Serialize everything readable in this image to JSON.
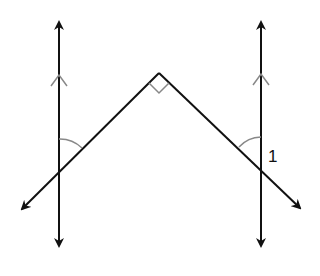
{
  "diagram": {
    "type": "geometry",
    "colors": {
      "line": "#111111",
      "mark": "#888888",
      "background": "#ffffff"
    },
    "parallel_lines": [
      {
        "id": "left",
        "x": 59,
        "y_top": 20,
        "y_bottom": 248,
        "parallel_marker": "arrow"
      },
      {
        "id": "right",
        "x": 261,
        "y_top": 20,
        "y_bottom": 248,
        "parallel_marker": "arrow"
      }
    ],
    "transversals": [
      {
        "id": "left-diagonal",
        "from": [
          159,
          73
        ],
        "to": [
          20,
          211
        ]
      },
      {
        "id": "right-diagonal",
        "from": [
          159,
          73
        ],
        "to": [
          302,
          210
        ]
      }
    ],
    "apex": {
      "x": 159,
      "y": 73,
      "right_angle_mark": true
    },
    "angle_marks": [
      {
        "id": "left-arc",
        "vertex": [
          59,
          171
        ]
      },
      {
        "id": "right-arc",
        "vertex": [
          261,
          168
        ]
      }
    ],
    "labels": [
      {
        "id": "angle-1",
        "text": "1",
        "x": 268,
        "y": 148
      }
    ]
  }
}
